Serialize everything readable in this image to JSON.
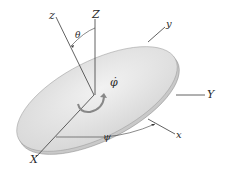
{
  "diagram": {
    "axes_fixed": {
      "X": "X",
      "Y": "Y",
      "Z": "Z"
    },
    "axes_body": {
      "x": "x",
      "y": "y",
      "z": "z"
    },
    "angles": {
      "nutation": "θ",
      "precession": "ψ",
      "spin_rate": "φ̇"
    },
    "colors": {
      "disk_face": "#e2e2e2",
      "disk_rim": "#cfcfcf",
      "lines": "#3a3a3a",
      "background": "#ffffff"
    }
  }
}
